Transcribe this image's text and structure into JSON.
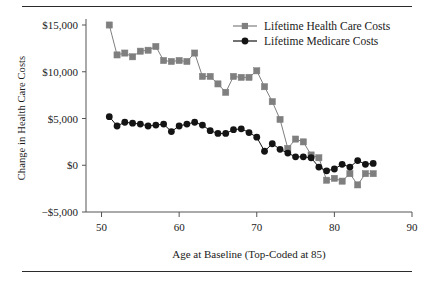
{
  "figure": {
    "has_top_rule": true,
    "has_bottom_rule": true,
    "rule_color": "#2b2b2b",
    "background": "#ffffff"
  },
  "axes": {
    "y_title": "Change in Health Care Costs",
    "x_title": "Age at Baseline (Top-Coded at 85)",
    "y_ticks": [
      "$15,000",
      "$10,000",
      "$5,000",
      "$0",
      "−$5,000"
    ],
    "x_ticks": [
      "50",
      "60",
      "70",
      "80",
      "90"
    ]
  },
  "legend": {
    "position": "top-right",
    "items": [
      {
        "label": "Lifetime Health Care Costs",
        "marker": "square",
        "color": "#7f7f7f"
      },
      {
        "label": "Lifetime Medicare Costs",
        "marker": "circle",
        "color": "#141414"
      }
    ]
  },
  "chart_data": {
    "type": "line",
    "title": "",
    "subtitle": "",
    "xlabel": "Age at Baseline (Top-Coded at 85)",
    "ylabel": "Change in Health Care Costs",
    "xlim": [
      48,
      90
    ],
    "ylim": [
      -5000,
      15000
    ],
    "xticks": [
      50,
      60,
      70,
      80,
      90
    ],
    "yticks": [
      -5000,
      0,
      5000,
      10000,
      15000
    ],
    "ytick_labels": [
      "−$5,000",
      "$0",
      "$5,000",
      "$10,000",
      "$15,000"
    ],
    "grid": false,
    "legend_position": "top right",
    "x": [
      51,
      52,
      53,
      54,
      55,
      56,
      57,
      58,
      59,
      60,
      61,
      62,
      63,
      64,
      65,
      66,
      67,
      68,
      69,
      70,
      71,
      72,
      73,
      74,
      75,
      76,
      77,
      78,
      79,
      80,
      81,
      82,
      83,
      84,
      85
    ],
    "series": [
      {
        "name": "Lifetime Health Care Costs",
        "marker": "square",
        "color": "#7f7f7f",
        "values": [
          15000,
          11800,
          12000,
          11600,
          12200,
          12300,
          12700,
          11200,
          11100,
          11200,
          11100,
          12000,
          9500,
          9500,
          8700,
          7800,
          9500,
          9400,
          9400,
          10100,
          8400,
          6800,
          4900,
          1800,
          2800,
          2500,
          1100,
          800,
          -1600,
          -1400,
          -1700,
          -900,
          -2100,
          -900,
          -900
        ]
      },
      {
        "name": "Lifetime Medicare Costs",
        "marker": "circle",
        "color": "#141414",
        "values": [
          5200,
          4200,
          4600,
          4500,
          4400,
          4200,
          4300,
          4400,
          3600,
          4200,
          4400,
          4600,
          4300,
          3700,
          3400,
          3400,
          3800,
          3900,
          3500,
          3000,
          1500,
          2300,
          1700,
          1300,
          900,
          900,
          800,
          -200,
          -600,
          -400,
          100,
          -200,
          500,
          100,
          200
        ]
      }
    ]
  }
}
